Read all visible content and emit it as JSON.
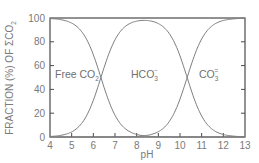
{
  "chart_data": {
    "type": "line",
    "title": "",
    "xlabel": "pH",
    "ylabel": "FRACTION (%) OF ΣCO2",
    "xlim": [
      4,
      13
    ],
    "ylim": [
      0,
      100
    ],
    "x_ticks": [
      4,
      5,
      6,
      7,
      8,
      9,
      10,
      11,
      12,
      13
    ],
    "y_ticks": [
      0,
      20,
      40,
      60,
      80,
      100
    ],
    "grid": false,
    "legend": "inline labels",
    "pK1": 6.35,
    "pK2": 10.33,
    "series": [
      {
        "name": "Free CO2",
        "label_main": "Free CO",
        "label_sub": "2",
        "label_sup": "",
        "x": [
          4,
          5,
          6,
          6.35,
          7,
          8,
          9,
          10,
          11
        ],
        "values": [
          99.6,
          95.7,
          69.1,
          50.0,
          18.2,
          2.2,
          0.2,
          0.0,
          0.0
        ]
      },
      {
        "name": "HCO3-",
        "label_main": "HCO",
        "label_sub": "3",
        "label_sup": "−",
        "x": [
          4,
          5,
          6,
          6.35,
          7,
          8,
          8.34,
          9,
          10,
          10.33,
          11,
          12,
          13
        ],
        "values": [
          0.4,
          4.3,
          30.8,
          49.8,
          81.6,
          97.3,
          98.0,
          95.3,
          67.5,
          49.9,
          17.6,
          2.1,
          0.2
        ]
      },
      {
        "name": "CO3=",
        "label_main": "CO",
        "label_sub": "3",
        "label_sup": "=",
        "x": [
          8,
          9,
          10,
          10.33,
          11,
          12,
          13
        ],
        "values": [
          0.5,
          4.5,
          31.9,
          50.0,
          82.4,
          97.9,
          99.8
        ]
      }
    ],
    "crossovers": [
      {
        "pH": 6.35,
        "value": 50
      },
      {
        "pH": 10.33,
        "value": 50
      }
    ]
  },
  "labels": {
    "ylabel_main": "FRACTION (%) OF ΣCO",
    "ylabel_sub": "2",
    "xlabel": "pH"
  }
}
